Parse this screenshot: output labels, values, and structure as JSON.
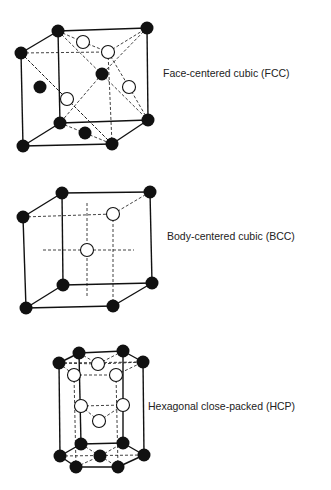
{
  "figure": {
    "structures": [
      {
        "id": "fcc",
        "label": "Face-centered cubic (FCC)",
        "label_pos": [
          163,
          67
        ],
        "solid_lines": [
          [
            [
              58,
              31
            ],
            [
              147,
              28
            ]
          ],
          [
            [
              21,
              53
            ],
            [
              58,
              31
            ]
          ],
          [
            [
              147,
              28
            ],
            [
              148,
              120
            ]
          ],
          [
            [
              21,
              53
            ],
            [
              23,
              146
            ]
          ],
          [
            [
              58,
              31
            ],
            [
              60,
              123
            ]
          ],
          [
            [
              60,
              123
            ],
            [
              148,
              120
            ]
          ],
          [
            [
              23,
              146
            ],
            [
              112,
              144
            ]
          ],
          [
            [
              112,
              144
            ],
            [
              148,
              120
            ]
          ],
          [
            [
              23,
              146
            ],
            [
              60,
              123
            ]
          ]
        ],
        "dashed_lines": [
          [
            [
              21,
              53
            ],
            [
              108,
              52
            ]
          ],
          [
            [
              108,
              52
            ],
            [
              147,
              28
            ]
          ],
          [
            [
              108,
              52
            ],
            [
              112,
              144
            ]
          ],
          [
            [
              58,
              31
            ],
            [
              148,
              120
            ]
          ],
          [
            [
              21,
              53
            ],
            [
              112,
              144
            ]
          ],
          [
            [
              58,
              31
            ],
            [
              83,
              42
            ]
          ],
          [
            [
              83,
              42
            ],
            [
              108,
              52
            ]
          ],
          [
            [
              147,
              28
            ],
            [
              102,
              74
            ]
          ],
          [
            [
              102,
              74
            ],
            [
              60,
              123
            ]
          ],
          [
            [
              108,
              52
            ],
            [
              129,
              87
            ]
          ],
          [
            [
              129,
              87
            ],
            [
              148,
              120
            ]
          ],
          [
            [
              67,
              99
            ],
            [
              112,
              144
            ]
          ],
          [
            [
              21,
              53
            ],
            [
              67,
              99
            ]
          ],
          [
            [
              60,
              123
            ],
            [
              85,
              133
            ]
          ],
          [
            [
              85,
              133
            ],
            [
              112,
              144
            ]
          ]
        ],
        "atoms_filled": [
          [
            58,
            31
          ],
          [
            147,
            28
          ],
          [
            21,
            53
          ],
          [
            102,
            74
          ],
          [
            40,
            87
          ],
          [
            60,
            123
          ],
          [
            148,
            120
          ],
          [
            85,
            133
          ],
          [
            23,
            146
          ],
          [
            112,
            144
          ]
        ],
        "atoms_open": [
          [
            83,
            42
          ],
          [
            108,
            52
          ],
          [
            129,
            87
          ],
          [
            67,
            99
          ]
        ]
      },
      {
        "id": "bcc",
        "label": "Body-centered cubic (BCC)",
        "label_pos": [
          167,
          230
        ],
        "solid_lines": [
          [
            [
              62,
              193
            ],
            [
              150,
              192
            ]
          ],
          [
            [
              23,
              217
            ],
            [
              62,
              193
            ]
          ],
          [
            [
              150,
              192
            ],
            [
              152,
              283
            ]
          ],
          [
            [
              23,
              217
            ],
            [
              26,
              308
            ]
          ],
          [
            [
              62,
              193
            ],
            [
              63,
              285
            ]
          ],
          [
            [
              63,
              285
            ],
            [
              152,
              283
            ]
          ],
          [
            [
              26,
              308
            ],
            [
              113,
              306
            ]
          ],
          [
            [
              113,
              306
            ],
            [
              152,
              283
            ]
          ],
          [
            [
              26,
              308
            ],
            [
              63,
              285
            ]
          ]
        ],
        "dashed_lines": [
          [
            [
              23,
              217
            ],
            [
              113,
              214
            ]
          ],
          [
            [
              113,
              214
            ],
            [
              150,
              192
            ]
          ],
          [
            [
              113,
              214
            ],
            [
              113,
              306
            ]
          ],
          [
            [
              87,
              203
            ],
            [
              87,
              298
            ]
          ],
          [
            [
              43,
              250
            ],
            [
              134,
              250
            ]
          ]
        ],
        "atoms_filled": [
          [
            62,
            193
          ],
          [
            150,
            192
          ],
          [
            23,
            217
          ],
          [
            63,
            285
          ],
          [
            152,
            283
          ],
          [
            26,
            308
          ],
          [
            113,
            306
          ]
        ],
        "atoms_open": [
          [
            113,
            214
          ],
          [
            87,
            250
          ]
        ]
      },
      {
        "id": "hcp",
        "label": "Hexagonal close-packed (HCP)",
        "label_pos": [
          148,
          400
        ],
        "solid_lines": [
          [
            [
              79,
              353
            ],
            [
              123,
              351
            ]
          ],
          [
            [
              59,
              363
            ],
            [
              79,
              353
            ]
          ],
          [
            [
              123,
              351
            ],
            [
              143,
              362
            ]
          ],
          [
            [
              59,
              363
            ],
            [
              60,
              456
            ]
          ],
          [
            [
              143,
              362
            ],
            [
              144,
              455
            ]
          ],
          [
            [
              79,
              353
            ],
            [
              81,
              444
            ]
          ],
          [
            [
              123,
              351
            ],
            [
              123,
              443
            ]
          ],
          [
            [
              81,
              444
            ],
            [
              123,
              443
            ]
          ],
          [
            [
              60,
              456
            ],
            [
              76,
              467
            ]
          ],
          [
            [
              76,
              467
            ],
            [
              118,
              467
            ]
          ],
          [
            [
              118,
              467
            ],
            [
              144,
              455
            ]
          ],
          [
            [
              60,
              456
            ],
            [
              81,
              444
            ]
          ],
          [
            [
              123,
              443
            ],
            [
              144,
              455
            ]
          ]
        ],
        "dashed_lines": [
          [
            [
              59,
              363
            ],
            [
              143,
              362
            ]
          ],
          [
            [
              59,
              363
            ],
            [
              74,
              375
            ]
          ],
          [
            [
              74,
              375
            ],
            [
              116,
              375
            ]
          ],
          [
            [
              116,
              375
            ],
            [
              143,
              362
            ]
          ],
          [
            [
              79,
              353
            ],
            [
              98,
              364
            ]
          ],
          [
            [
              98,
              364
            ],
            [
              123,
              351
            ]
          ],
          [
            [
              74,
              375
            ],
            [
              76,
              467
            ]
          ],
          [
            [
              116,
              375
            ],
            [
              118,
              467
            ]
          ],
          [
            [
              81,
              406
            ],
            [
              123,
              405
            ]
          ],
          [
            [
              81,
              406
            ],
            [
              99,
              421
            ]
          ],
          [
            [
              99,
              421
            ],
            [
              123,
              405
            ]
          ],
          [
            [
              60,
              456
            ],
            [
              144,
              455
            ]
          ],
          [
            [
              81,
              444
            ],
            [
              100,
              456
            ]
          ],
          [
            [
              100,
              456
            ],
            [
              123,
              443
            ]
          ],
          [
            [
              76,
              467
            ],
            [
              100,
              456
            ]
          ],
          [
            [
              100,
              456
            ],
            [
              118,
              467
            ]
          ],
          [
            [
              59,
              363
            ],
            [
              98,
              364
            ]
          ],
          [
            [
              98,
              364
            ],
            [
              143,
              362
            ]
          ]
        ],
        "atoms_filled": [
          [
            79,
            353
          ],
          [
            123,
            351
          ],
          [
            59,
            363
          ],
          [
            143,
            362
          ],
          [
            81,
            444
          ],
          [
            123,
            443
          ],
          [
            60,
            456
          ],
          [
            100,
            456
          ],
          [
            144,
            455
          ],
          [
            76,
            467
          ],
          [
            118,
            467
          ]
        ],
        "atoms_open": [
          [
            98,
            364
          ],
          [
            74,
            375
          ],
          [
            116,
            375
          ],
          [
            81,
            406
          ],
          [
            123,
            405
          ],
          [
            99,
            421
          ]
        ]
      }
    ],
    "style": {
      "line_color": "#111111",
      "atom_fill": "#111111",
      "open_fill": "#ffffff",
      "atom_radius": 6.5
    }
  }
}
